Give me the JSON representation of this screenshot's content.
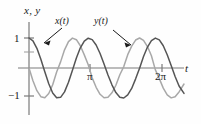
{
  "figure": {
    "axis_label_vertical": "x, y",
    "axis_label_horizontal": "t",
    "curve_label_x": "x(t)",
    "curve_label_y": "y(t)"
  },
  "ticks": {
    "y_top": "1",
    "y_bottom": "−1",
    "x_pi": "π",
    "x_2pi": "2π"
  },
  "chart_data": {
    "type": "line",
    "title": "",
    "xlabel": "t",
    "ylabel": "x, y",
    "xlim": [
      0,
      7.85
    ],
    "ylim": [
      -1.45,
      1.3
    ],
    "xticks": [
      3.1416,
      6.2832
    ],
    "xticklabels": [
      "π",
      "2π"
    ],
    "yticks": [
      -1,
      1
    ],
    "yticklabels": [
      "−1",
      "1"
    ],
    "grid": false,
    "legend": "inline-annotations",
    "annotations": [
      {
        "text": "x(t)",
        "points_to_curve": "x",
        "arrow": true
      },
      {
        "text": "y(t)",
        "points_to_curve": "y",
        "arrow": true
      }
    ],
    "series": [
      {
        "name": "x(t)",
        "color": "#555555",
        "formula": "cos(2.2 t)",
        "amplitude": 1,
        "period": 2.856,
        "phase_deg": 0,
        "x": [
          0,
          0.2,
          0.4,
          0.6,
          0.8,
          1.0,
          1.2,
          1.4,
          1.6,
          1.8,
          2.0,
          2.2,
          2.4,
          2.6,
          2.8,
          3.0,
          3.2,
          3.4,
          3.6,
          3.8,
          4.0,
          4.2,
          4.4,
          4.6,
          4.8,
          5.0,
          5.2,
          5.4,
          5.6,
          5.8,
          6.0,
          6.2,
          6.4,
          6.6,
          6.8,
          7.0,
          7.2,
          7.4,
          7.6,
          7.85
        ],
        "values": [
          1.0,
          0.905,
          0.655,
          0.292,
          -0.125,
          -0.524,
          -0.831,
          -0.991,
          -0.979,
          -0.796,
          -0.473,
          -0.073,
          0.334,
          0.672,
          0.899,
          0.994,
          0.945,
          0.765,
          0.482,
          0.135,
          -0.231,
          -0.561,
          -0.818,
          -0.974,
          -0.999,
          -0.896,
          -0.682,
          -0.362,
          -0.008,
          0.386,
          0.699,
          0.914,
          0.998,
          0.936,
          0.741,
          0.443,
          0.085,
          -0.281,
          -0.601,
          -0.845
        ]
      },
      {
        "name": "y(t)",
        "color": "#a8a8a8",
        "formula": "−sin(2.2 t)",
        "amplitude": 1,
        "period": 2.856,
        "phase_deg": -90,
        "x": [
          0,
          0.2,
          0.4,
          0.6,
          0.8,
          1.0,
          1.2,
          1.4,
          1.6,
          1.8,
          2.0,
          2.2,
          2.4,
          2.6,
          2.8,
          3.0,
          3.2,
          3.4,
          3.6,
          3.8,
          4.0,
          4.2,
          4.4,
          4.6,
          4.8,
          5.0,
          5.2,
          5.4,
          5.6,
          5.8,
          6.0,
          6.2,
          6.4,
          6.6,
          6.8,
          7.0,
          7.2,
          7.4,
          7.6,
          7.85
        ],
        "values": [
          0.0,
          -0.426,
          -0.756,
          -0.956,
          -0.992,
          -0.852,
          -0.557,
          -0.135,
          0.204,
          0.606,
          0.881,
          0.997,
          0.943,
          0.741,
          0.437,
          0.108,
          -0.328,
          -0.644,
          -0.876,
          -0.991,
          -0.973,
          -0.828,
          -0.575,
          -0.226,
          0.047,
          0.444,
          0.731,
          0.932,
          1.0,
          0.923,
          0.715,
          0.406,
          -0.063,
          -0.353,
          -0.672,
          -0.897,
          -0.996,
          -0.96,
          -0.799,
          -0.534
        ]
      }
    ]
  },
  "colors": {
    "curve_x": "#555555",
    "curve_y": "#a8a8a8",
    "axis": "#7a7a7a",
    "text": "#1a1a1a"
  }
}
